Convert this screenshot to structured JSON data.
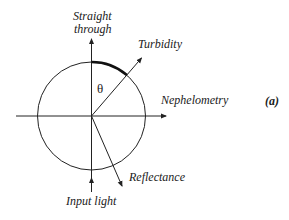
{
  "diagram": {
    "panel_label": "(a)",
    "angle_symbol": "θ",
    "labels": {
      "straight_through_line1": "Straight",
      "straight_through_line2": "through",
      "turbidity": "Turbidity",
      "nephelometry": "Nephelometry",
      "reflectance": "Reflectance",
      "input_light": "Input light"
    },
    "geometry": {
      "center": [
        91.5,
        116
      ],
      "radius": 54,
      "stroke_color": "#222222",
      "background": "#ffffff"
    }
  }
}
